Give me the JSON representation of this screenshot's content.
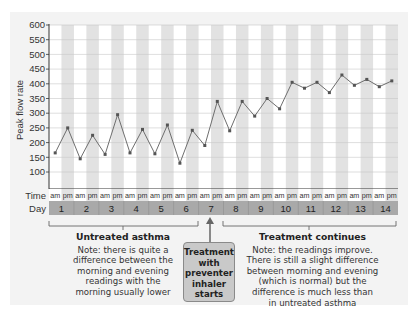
{
  "chart_data": {
    "type": "line",
    "title": "",
    "xlabel": "",
    "ylabel": "Peak flow rate",
    "ylim": [
      45,
      600
    ],
    "yticks": [
      100,
      150,
      200,
      250,
      300,
      350,
      400,
      450,
      500,
      550,
      600
    ],
    "grid": true,
    "legend": "none",
    "time_row_label": "Time",
    "day_row_label": "Day",
    "days": [
      "1",
      "2",
      "3",
      "4",
      "5",
      "6",
      "7",
      "8",
      "9",
      "10",
      "11",
      "12",
      "13",
      "14"
    ],
    "time_labels": [
      "am",
      "pm"
    ],
    "x": [
      "1 am",
      "1 pm",
      "2 am",
      "2 pm",
      "3 am",
      "3 pm",
      "4 am",
      "4 pm",
      "5 am",
      "5 pm",
      "6 am",
      "6 pm",
      "7 am",
      "7 pm",
      "8 am",
      "8 pm",
      "9 am",
      "9 pm",
      "10 am",
      "10 pm",
      "11 am",
      "11 pm",
      "12 am",
      "12 pm",
      "13 am",
      "13 pm",
      "14 am",
      "14 pm"
    ],
    "series": [
      {
        "name": "Peak flow rate",
        "values": [
          165,
          250,
          145,
          225,
          160,
          295,
          165,
          245,
          162,
          260,
          130,
          242,
          190,
          340,
          240,
          340,
          290,
          350,
          315,
          405,
          385,
          405,
          370,
          430,
          395,
          415,
          390,
          410
        ]
      }
    ],
    "annotations": {
      "untreated": {
        "heading": "Untreated asthma",
        "lines": [
          "Note: there is quite a",
          "difference between the",
          "morning and evening",
          "readings with the",
          "morning usually lower"
        ]
      },
      "treatment_start": {
        "lines": [
          "Treatment",
          "with",
          "preventer",
          "inhaler",
          "starts"
        ]
      },
      "treatment_continues": {
        "heading": "Treatment continues",
        "lines": [
          "Note: the readings improve.",
          "There is still a slight difference",
          "between morning and evening",
          "(which is normal) but the",
          "difference is much less than",
          "in untreated asthma"
        ]
      }
    },
    "colors": {
      "panel": "#f3f3f3",
      "pm_band": "#e2e2e2",
      "grid": "#c8c8c8",
      "line": "#6e6e6e",
      "marker": "#555555",
      "day_bar": "#a9a9a9",
      "axis": "#333333"
    }
  }
}
